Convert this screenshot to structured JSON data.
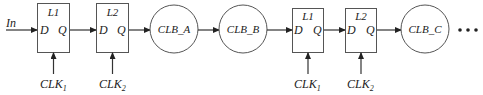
{
  "diagram": {
    "input_label": "In",
    "latches": [
      {
        "name": "L1",
        "d": "D",
        "q": "Q",
        "clock": "CLK",
        "clock_sub": "1"
      },
      {
        "name": "L2",
        "d": "D",
        "q": "Q",
        "clock": "CLK",
        "clock_sub": "2"
      },
      {
        "name": "L1",
        "d": "D",
        "q": "Q",
        "clock": "CLK",
        "clock_sub": "1"
      },
      {
        "name": "L2",
        "d": "D",
        "q": "Q",
        "clock": "CLK",
        "clock_sub": "2"
      }
    ],
    "clbs": [
      {
        "label": "CLB_A"
      },
      {
        "label": "CLB_B"
      },
      {
        "label": "CLB_C"
      }
    ],
    "continuation": "..."
  }
}
